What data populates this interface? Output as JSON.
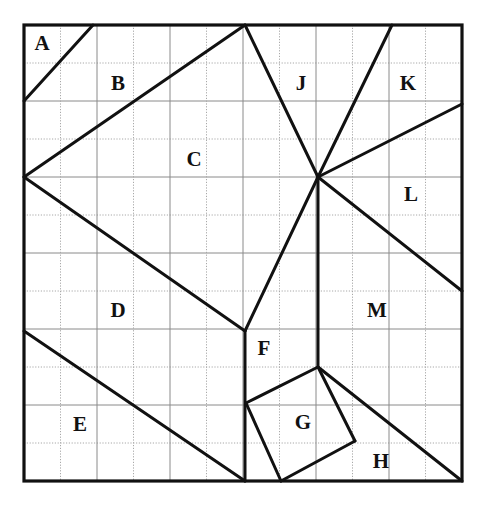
{
  "figure": {
    "canvas": {
      "width": 483,
      "height": 512
    },
    "background_color": "#ffffff",
    "line_color": "#111111",
    "grid_color": "#8a8a8a",
    "grid_dotted_color": "#a8a8a8",
    "square": {
      "x0": 24,
      "y0": 25,
      "x1": 462,
      "y1": 481
    },
    "grid": {
      "columns": 12,
      "rows": 12,
      "cell_width": 36.5,
      "cell_height": 38
    },
    "border_stroke_width": 3.2,
    "cut_stroke_width": 3.0,
    "grid_stroke_width": 1.0
  },
  "vertices": {
    "top_left": [
      24,
      25
    ],
    "top_center": [
      245,
      25
    ],
    "top_k": [
      392,
      25
    ],
    "top_right": [
      462,
      25
    ],
    "left_mid": [
      24,
      177
    ],
    "hub": [
      318,
      177
    ],
    "right_k": [
      462,
      104
    ],
    "right_l": [
      462,
      291
    ],
    "left_de": [
      24,
      331
    ],
    "f_vertex": [
      245,
      331
    ],
    "a_left": [
      24,
      101
    ],
    "a_top": [
      93,
      25
    ],
    "g_top": [
      318,
      367
    ],
    "g_left": [
      246,
      403
    ],
    "g_bottom": [
      281,
      481
    ],
    "g_right": [
      355,
      441
    ],
    "bottom_left": [
      24,
      481
    ],
    "bottom_f": [
      245,
      481
    ],
    "bottom_right": [
      462,
      481
    ]
  },
  "cut_lines": [
    {
      "name": "cut-a-b",
      "points": "24,101 93,25"
    },
    {
      "name": "cut-b-c",
      "points": "24,177 245,25"
    },
    {
      "name": "cut-c-d",
      "points": "24,177 245,331"
    },
    {
      "name": "cut-c-j-hub",
      "points": "245,25 318,177"
    },
    {
      "name": "cut-hub-k",
      "points": "318,177 392,25"
    },
    {
      "name": "cut-hub-right",
      "points": "318,177 462,104"
    },
    {
      "name": "cut-hub-l-m",
      "points": "318,177 462,291"
    },
    {
      "name": "cut-hub-f",
      "points": "318,177 245,331"
    },
    {
      "name": "cut-hub-vertical",
      "points": "318,177 318,367"
    },
    {
      "name": "cut-f-bottom",
      "points": "245,331 245,481"
    },
    {
      "name": "cut-d-e",
      "points": "24,331 245,481"
    },
    {
      "name": "cut-g-top-left",
      "points": "318,367 246,403"
    },
    {
      "name": "cut-g-left-bottom",
      "points": "246,403 281,481"
    },
    {
      "name": "cut-g-bottom-right",
      "points": "281,481 355,441"
    },
    {
      "name": "cut-g-right-top",
      "points": "355,441 318,367"
    },
    {
      "name": "cut-h-diagonal",
      "points": "318,367 462,481"
    }
  ],
  "labels": [
    {
      "id": "A",
      "text": "A",
      "x": 42,
      "y": 45
    },
    {
      "id": "B",
      "text": "B",
      "x": 118,
      "y": 85
    },
    {
      "id": "C",
      "text": "C",
      "x": 194,
      "y": 161
    },
    {
      "id": "D",
      "text": "D",
      "x": 118,
      "y": 312
    },
    {
      "id": "E",
      "text": "E",
      "x": 80,
      "y": 426
    },
    {
      "id": "F",
      "text": "F",
      "x": 264,
      "y": 350
    },
    {
      "id": "G",
      "text": "G",
      "x": 303,
      "y": 424
    },
    {
      "id": "H",
      "text": "H",
      "x": 381,
      "y": 463
    },
    {
      "id": "J",
      "text": "J",
      "x": 301,
      "y": 85
    },
    {
      "id": "K",
      "text": "K",
      "x": 408,
      "y": 85
    },
    {
      "id": "L",
      "text": "L",
      "x": 411,
      "y": 196
    },
    {
      "id": "M",
      "text": "M",
      "x": 377,
      "y": 312
    }
  ],
  "chart_data": {
    "type": "diagram",
    "region_labels": [
      "A",
      "B",
      "C",
      "D",
      "E",
      "F",
      "G",
      "H",
      "J",
      "K",
      "L",
      "M"
    ],
    "region_count": 12,
    "grid_columns": 12,
    "grid_rows": 12
  }
}
